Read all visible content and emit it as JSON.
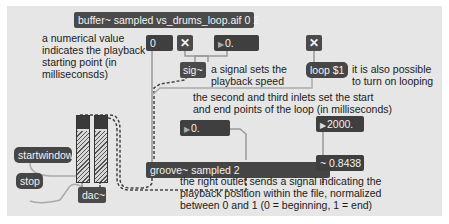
{
  "patcher": {
    "buffer_object": "buffer~ sampled vs_drums_loop.aif 0 2",
    "start_number": "0",
    "toggle_speed": "✕",
    "speed_number": "0.",
    "sig_object": "sig~",
    "toggle_loop": "✕",
    "loop_message": "loop $1",
    "loop_start_number": "0.",
    "loop_end_number": "2000.",
    "groove_object": "groove~ sampled 2",
    "position_signal": "0.8438",
    "signal_symbol": "~",
    "startwindow_message": "startwindow",
    "stop_message": "stop",
    "dac_object": "dac~",
    "number_triangle": "▶"
  },
  "comments": {
    "start_point_1": "a numerical value",
    "start_point_2": "indicates the playback",
    "start_point_3": "starting point (in",
    "start_point_4": "milliseconsds)",
    "speed_1": "a signal sets the",
    "speed_2": "playback speed",
    "loop_1": "it is also possible",
    "loop_2": "to turn on looping",
    "inlets_1": "the second and third inlets set the start",
    "inlets_2": "and end points of the loop (in milliseconds)",
    "outlet_1": "the right outlet sends a signal indicating the",
    "outlet_2": "playback position within the file, normalized",
    "outlet_3": "between 0 and 1 (0 = beginning, 1 = end)"
  },
  "colors": {
    "canvas": "#e6e6e6",
    "object_bg": "#4a4a4a",
    "patch_cord": "#a0a0a0",
    "signal_cord": "#555555"
  }
}
